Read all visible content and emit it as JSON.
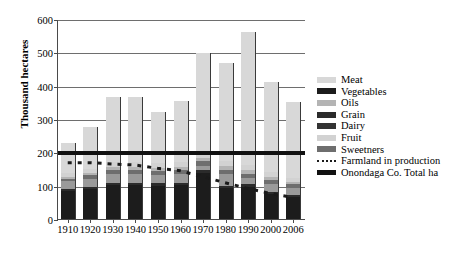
{
  "chart_data": {
    "type": "bar",
    "title": "",
    "subtitle": "",
    "xlabel": "",
    "ylabel": "Thousand hectares",
    "ylim": [
      0,
      600
    ],
    "yticks": [
      0,
      100,
      200,
      300,
      400,
      500,
      600
    ],
    "grid": true,
    "stacked": true,
    "legend_position": "right",
    "categories": [
      "1910",
      "1920",
      "1930",
      "1940",
      "1950",
      "1960",
      "1970",
      "1980",
      "1990",
      "2000",
      "2006"
    ],
    "series": [
      {
        "name": "Vegetables",
        "color": "#1c1c1c",
        "values": [
          88,
          92,
          104,
          105,
          103,
          104,
          140,
          96,
          100,
          78,
          70
        ]
      },
      {
        "name": "Grain",
        "color": "#2b2b2b",
        "values": [
          6,
          6,
          7,
          7,
          7,
          7,
          9,
          7,
          7,
          6,
          5
        ]
      },
      {
        "name": "Dairy",
        "color": "#9a9a9a",
        "values": [
          22,
          26,
          27,
          27,
          26,
          27,
          13,
          35,
          18,
          25,
          22
        ]
      },
      {
        "name": "Sweetners",
        "color": "#6e6e6e",
        "values": [
          8,
          10,
          12,
          12,
          12,
          12,
          14,
          13,
          14,
          12,
          10
        ]
      },
      {
        "name": "Oils",
        "color": "#b4b4b4",
        "values": [
          6,
          8,
          9,
          9,
          9,
          9,
          11,
          10,
          11,
          9,
          8
        ]
      },
      {
        "name": "Fruit",
        "color": "#d2d2d2",
        "values": [
          10,
          12,
          14,
          14,
          14,
          14,
          16,
          15,
          16,
          14,
          12
        ]
      },
      {
        "name": "Meat",
        "color": "#d8d8d8",
        "values": [
          90,
          126,
          197,
          196,
          154,
          184,
          297,
          294,
          399,
          271,
          228
        ]
      }
    ],
    "lines": [
      {
        "name": "Farmland in production",
        "style": "dotted",
        "color": "#1a1a1a",
        "values": [
          172,
          172,
          168,
          165,
          155,
          148,
          130,
          112,
          95,
          80,
          68
        ]
      },
      {
        "name": "Onondaga Co. Total ha",
        "style": "solid-thick",
        "color": "#111111",
        "constant": 200
      }
    ],
    "totals": [
      230,
      280,
      370,
      370,
      325,
      357,
      500,
      470,
      565,
      415,
      355
    ]
  },
  "legend": {
    "entries": [
      {
        "label": "Meat",
        "swatch": "light",
        "color": "#d8d8d8"
      },
      {
        "label": "Vegetables",
        "swatch": "dark",
        "color": "#1c1c1c"
      },
      {
        "label": "Oils",
        "swatch": "light",
        "color": "#b4b4b4"
      },
      {
        "label": "Grain",
        "swatch": "dark",
        "color": "#2b2b2b"
      },
      {
        "label": "Dairy",
        "swatch": "dark",
        "color": "#333333"
      },
      {
        "label": "Fruit",
        "swatch": "light",
        "color": "#d2d2d2"
      },
      {
        "label": "Sweetners",
        "swatch": "mid",
        "color": "#6e6e6e"
      },
      {
        "label": "Farmland in production",
        "swatch": "dashed",
        "color": "#1a1a1a"
      },
      {
        "label": "Onondaga Co. Total ha",
        "swatch": "thick",
        "color": "#111111"
      }
    ]
  }
}
